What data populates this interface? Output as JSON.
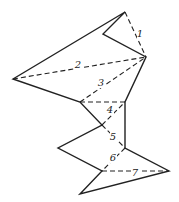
{
  "diagram": {
    "colors": {
      "stroke": "#222222",
      "background": "#ffffff"
    },
    "vertices": {
      "A": [
        125,
        12
      ],
      "B": [
        103,
        34
      ],
      "C": [
        146,
        57
      ],
      "D": [
        13,
        79
      ],
      "E": [
        80,
        102
      ],
      "F": [
        125,
        102
      ],
      "G": [
        102,
        125
      ],
      "H": [
        125,
        148
      ],
      "I": [
        58,
        148
      ],
      "J": [
        102,
        171
      ],
      "K": [
        169,
        171
      ],
      "L": [
        80,
        194
      ]
    },
    "outline": [
      "A",
      "D",
      "E",
      "G",
      "I",
      "J",
      "L",
      "K",
      "H",
      "F",
      "C",
      "B",
      "A"
    ],
    "diagonals": [
      {
        "label": "1",
        "from": "A",
        "to": "C",
        "label_pos": [
          140,
          37
        ]
      },
      {
        "label": "2",
        "from": "D",
        "to": "C",
        "label_pos": [
          78,
          68
        ]
      },
      {
        "label": "3",
        "from": "E",
        "to": "C",
        "label_pos": [
          101,
          86
        ]
      },
      {
        "label": "4",
        "from": "E",
        "to": "F",
        "label_pos": [
          110,
          113
        ]
      },
      {
        "label": "5",
        "from": "G",
        "to": "H",
        "label_pos": [
          113,
          140
        ]
      },
      {
        "label": "6",
        "from": "H",
        "to": "J",
        "label_pos": [
          113,
          161
        ]
      },
      {
        "label": "7",
        "from": "J",
        "to": "K",
        "label_pos": [
          135,
          176
        ]
      }
    ],
    "extra_dashed": [
      {
        "from": "G",
        "to": "F"
      }
    ]
  }
}
